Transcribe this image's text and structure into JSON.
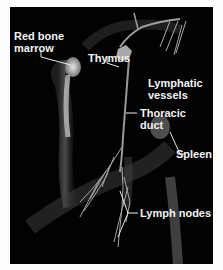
{
  "figure": {
    "background": "#020202",
    "labels": {
      "red_bone_marrow": [
        "Red bone",
        "marrow"
      ],
      "thymus": "Thymus",
      "lymphatic_vessels": [
        "Lymphatic",
        "vessels"
      ],
      "thoracic_duct": [
        "Thoracic",
        "duct"
      ],
      "spleen": "Spleen",
      "lymph_nodes": "Lymph nodes"
    }
  }
}
